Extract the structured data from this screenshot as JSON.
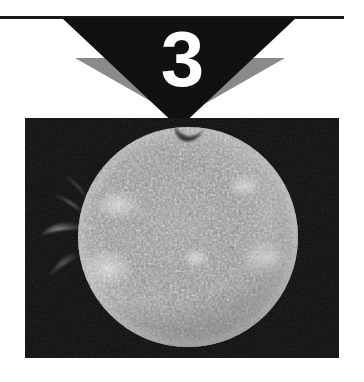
{
  "page": {
    "background_color": "#ffffff",
    "width": 364,
    "height": 382
  },
  "header": {
    "rule": {
      "name": "horizontal-rule",
      "color": "#1a1a1a",
      "width": 344,
      "top": 16,
      "thickness": 3
    },
    "issue_number": "3",
    "number_color": "#ffffff",
    "chevron_primary_color": "#111111",
    "chevron_secondary_color": "#8a8a8a"
  },
  "photo": {
    "name": "solar-photograph",
    "background_color": "#0b0b0b",
    "subject": "sun-disk",
    "description": "Grayscale telescopic photograph of the Sun showing mottled chromospheric granulation, bright plage regions, and a wispy prominence arcing off the upper-left limb against a black sky",
    "disk": {
      "center_x": 188,
      "center_y": 237,
      "radius": 110,
      "limb_color": "#d8d8d8",
      "core_color": "#8e8e8e",
      "shadow_color": "#1a1a1a"
    },
    "prominence": {
      "name": "solar-prominence",
      "position": "upper-left-limb",
      "color": "#b9b9b9"
    },
    "bright_regions": [
      {
        "name": "plage-upper-left",
        "x": 118,
        "y": 205,
        "rx": 22,
        "ry": 15
      },
      {
        "name": "plage-lower-left",
        "x": 108,
        "y": 268,
        "rx": 26,
        "ry": 20
      },
      {
        "name": "plage-right",
        "x": 268,
        "y": 258,
        "rx": 24,
        "ry": 18
      },
      {
        "name": "plage-center",
        "x": 196,
        "y": 258,
        "rx": 14,
        "ry": 10
      },
      {
        "name": "plage-upper-right",
        "x": 244,
        "y": 186,
        "rx": 16,
        "ry": 11
      }
    ]
  }
}
